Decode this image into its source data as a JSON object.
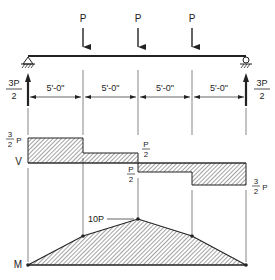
{
  "loads": {
    "label": "P",
    "positions_x": [
      83,
      138,
      192
    ]
  },
  "reactions": {
    "left": {
      "numerator": "3P",
      "denominator": "2"
    },
    "right": {
      "numerator": "3P",
      "denominator": "2"
    }
  },
  "spans": [
    "5'-0\"",
    "5'-0\"",
    "5'-0\"",
    "5'-0\""
  ],
  "shear_diagram": {
    "axis_label": "V",
    "labels": {
      "left_top": {
        "numerator": "3",
        "denominator": "2",
        "suffix": "P"
      },
      "mid_upper": {
        "numerator": "P",
        "denominator": "2"
      },
      "mid_lower": {
        "numerator": "P",
        "denominator": "2"
      },
      "right_bottom": {
        "numerator": "3",
        "denominator": "2",
        "suffix": "P"
      }
    },
    "values": [
      "3P/2",
      "P/2",
      "-P/2",
      "-3P/2"
    ]
  },
  "moment_diagram": {
    "axis_label": "M",
    "peak_label": "10P",
    "values": [
      0,
      7.5,
      10,
      7.5,
      0
    ]
  },
  "colors": {
    "line": "#222222",
    "hatch": "#333333",
    "background": "#ffffff"
  }
}
